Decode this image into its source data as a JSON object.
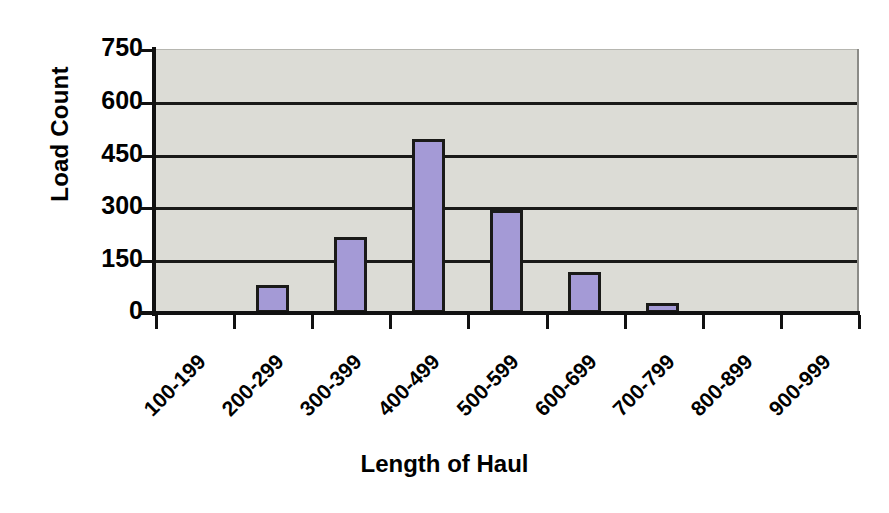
{
  "chart_data": {
    "type": "bar",
    "title": "",
    "xlabel": "Length of Haul",
    "ylabel": "Load Count",
    "categories": [
      "100-199",
      "200-299",
      "300-399",
      "400-499",
      "500-599",
      "600-699",
      "700-799",
      "800-899",
      "900-999"
    ],
    "values": [
      0,
      80,
      218,
      495,
      295,
      118,
      28,
      0,
      0
    ],
    "ylim": [
      0,
      750
    ],
    "yticks": [
      0,
      150,
      300,
      450,
      600,
      750
    ],
    "ytick_labels": [
      "0",
      "150",
      "300",
      "450",
      "600",
      "750"
    ],
    "grid": true,
    "grid_axis": "y",
    "legend": "none",
    "series": [
      {
        "name": "Load Count",
        "values": [
          0,
          80,
          218,
          495,
          295,
          118,
          28,
          0,
          0
        ]
      }
    ],
    "colors": {
      "bar_fill": "#a49ad6",
      "bar_border": "#1a1a18",
      "plot_background": "#dcdcd6",
      "gridline": "#1a1a18",
      "axis": "#111111",
      "text": "#000000",
      "page_background": "#ffffff"
    }
  }
}
